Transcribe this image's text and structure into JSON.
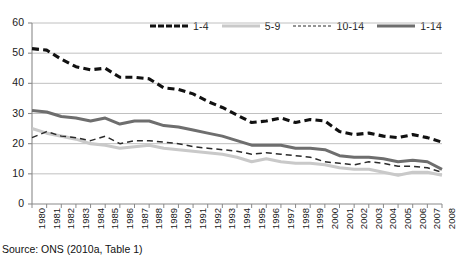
{
  "source_note": "Source: ONS (2010a, Table 1)",
  "legend": {
    "position": "top",
    "items": [
      {
        "label": "1-4",
        "style": "heavy-dashed",
        "color": "#111111",
        "name": "legend-item-1-4"
      },
      {
        "label": "5-9",
        "style": "light-solid",
        "color": "#c9c9c9",
        "name": "legend-item-5-9"
      },
      {
        "label": "10-14",
        "style": "thin-dashed",
        "color": "#2b2b2b",
        "name": "legend-item-10-14"
      },
      {
        "label": "1-14",
        "style": "medium-solid",
        "color": "#6e6e6e",
        "name": "legend-item-1-14"
      }
    ]
  },
  "chart_data": {
    "type": "line",
    "title": "",
    "xlabel": "",
    "ylabel": "",
    "ylim": [
      0,
      60
    ],
    "yticks": [
      0,
      10,
      20,
      30,
      40,
      50,
      60
    ],
    "grid": true,
    "legend_position": "top",
    "categories": [
      "1980",
      "1981",
      "1982",
      "1983",
      "1984",
      "1985",
      "1986",
      "1987",
      "1988",
      "1989",
      "1990",
      "1991",
      "1992",
      "1993",
      "1994",
      "1995",
      "1996",
      "1997",
      "1998",
      "1999",
      "2000",
      "2001",
      "2002",
      "2003",
      "2004",
      "2005",
      "2006",
      "2007",
      "2008"
    ],
    "series": [
      {
        "name": "1-4",
        "color": "#111111",
        "style": "heavy-dashed",
        "values": [
          51.5,
          51.0,
          48.0,
          45.5,
          44.5,
          45.0,
          42.0,
          42.0,
          41.5,
          38.5,
          38.0,
          36.5,
          34.0,
          32.0,
          29.5,
          27.0,
          27.5,
          28.5,
          27.0,
          28.0,
          27.5,
          24.0,
          23.0,
          23.5,
          22.5,
          22.0,
          23.0,
          22.0,
          20.5
        ]
      },
      {
        "name": "5-9",
        "color": "#c9c9c9",
        "style": "light-solid",
        "values": [
          25.0,
          23.5,
          22.5,
          21.5,
          20.0,
          19.5,
          18.5,
          19.0,
          19.5,
          18.5,
          18.0,
          17.5,
          17.0,
          16.5,
          15.5,
          14.0,
          15.0,
          14.0,
          13.5,
          13.5,
          13.0,
          12.0,
          11.5,
          11.5,
          10.5,
          9.5,
          10.5,
          10.5,
          9.5
        ]
      },
      {
        "name": "10-14",
        "color": "#2b2b2b",
        "style": "thin-dashed",
        "values": [
          22.0,
          24.0,
          22.5,
          22.0,
          21.0,
          22.5,
          20.0,
          21.0,
          21.0,
          20.5,
          20.0,
          19.0,
          18.5,
          18.0,
          17.5,
          16.5,
          17.0,
          16.5,
          16.0,
          15.5,
          14.0,
          13.5,
          13.0,
          14.0,
          13.5,
          12.5,
          12.5,
          12.0,
          10.5
        ]
      },
      {
        "name": "1-14",
        "color": "#6e6e6e",
        "style": "medium-solid",
        "values": [
          31.0,
          30.5,
          29.0,
          28.5,
          27.5,
          28.5,
          26.5,
          27.5,
          27.5,
          26.0,
          25.5,
          24.5,
          23.5,
          22.5,
          21.0,
          19.5,
          19.5,
          19.5,
          18.5,
          18.5,
          18.0,
          16.0,
          15.5,
          15.5,
          15.0,
          14.0,
          14.5,
          14.0,
          11.5
        ]
      }
    ]
  }
}
